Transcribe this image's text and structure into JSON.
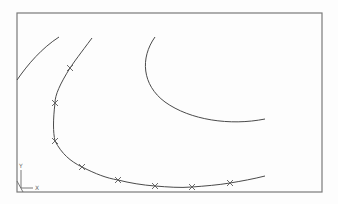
{
  "viewport": {
    "type": "cad-drawing-viewport",
    "frame": {
      "left": 17,
      "top": 13,
      "right": 322,
      "bottom": 192,
      "color": "#7a7a7a"
    },
    "ucs_icon": {
      "x_label": "X",
      "y_label": "Y"
    }
  },
  "curves": [
    {
      "name": "upper-left-arc",
      "path": "M17,80 C28,64 42,48 59,37",
      "color": "#4a4a4a"
    },
    {
      "name": "middle-spline",
      "path": "M155,37 C140,58 142,85 165,102 C190,120 230,126 265,119",
      "color": "#4a4a4a"
    },
    {
      "name": "fit-point-spline",
      "path": "M92,38 C80,54 74,62 70,68 C60,84 55,95 55,103 C53,120 53,132 55,141 C62,154 70,161 82,167 C96,174 106,178 118,180 C130,183 142,185 155,186 C168,187 180,188 192,187 C205,186 218,185 230,183 C242,181 253,179 265,176",
      "color": "#4a4a4a",
      "fit_points": [
        {
          "x": 70,
          "y": 68
        },
        {
          "x": 55,
          "y": 103
        },
        {
          "x": 55,
          "y": 141
        },
        {
          "x": 82,
          "y": 167
        },
        {
          "x": 118,
          "y": 180
        },
        {
          "x": 155,
          "y": 186
        },
        {
          "x": 192,
          "y": 187
        },
        {
          "x": 230,
          "y": 183
        }
      ]
    }
  ],
  "marker_glyph": "x-mark"
}
